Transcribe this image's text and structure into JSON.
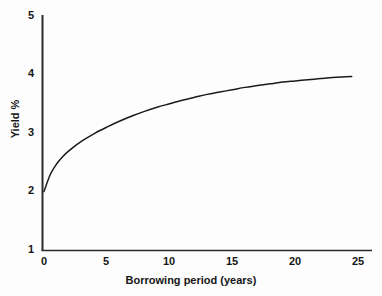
{
  "chart_data": {
    "type": "line",
    "title": "",
    "xlabel": "Borrowing period (years)",
    "ylabel": "Yield %",
    "xlim": [
      -0.8,
      26
    ],
    "ylim": [
      1,
      5
    ],
    "xticks": [
      "0",
      "5",
      "10",
      "15",
      "20",
      "25"
    ],
    "xtick_values": [
      0,
      5,
      10,
      15,
      20,
      25
    ],
    "yticks": [
      "1",
      "2",
      "3",
      "4",
      "5"
    ],
    "ytick_values": [
      1,
      2,
      3,
      4,
      5
    ],
    "grid": false,
    "legend": false,
    "series": [
      {
        "name": "Yield curve",
        "color": "#1a1a1a",
        "x": [
          0,
          0.5,
          1,
          1.5,
          2,
          3,
          4,
          5,
          6,
          7,
          8,
          9,
          10,
          11,
          12,
          13,
          14,
          15,
          16,
          17,
          18,
          19,
          20,
          21,
          22,
          23,
          24,
          24.5
        ],
        "y": [
          2.0,
          2.29,
          2.47,
          2.6,
          2.7,
          2.86,
          2.99,
          3.1,
          3.2,
          3.29,
          3.37,
          3.44,
          3.5,
          3.56,
          3.61,
          3.66,
          3.7,
          3.74,
          3.78,
          3.81,
          3.84,
          3.87,
          3.89,
          3.91,
          3.93,
          3.95,
          3.96,
          3.965
        ]
      }
    ],
    "annotations": []
  },
  "axes": {
    "axis_color": "#2b2b2b",
    "curve_color": "#1a1a1a",
    "background": "#fdfdfd"
  }
}
